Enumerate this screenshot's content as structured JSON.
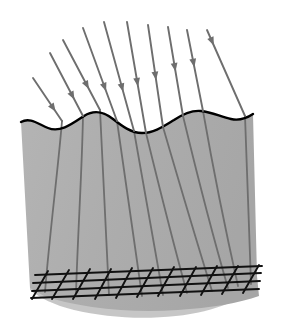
{
  "figure": {
    "title": "",
    "caption": "",
    "background_color": "#ffffff",
    "width": 282,
    "height": 331
  },
  "colors": {
    "medium_fill": "#adadad",
    "medium_fill_light": "#b8b8b8",
    "medium_fill_shadow": "#a3a3a3",
    "surface_stroke": "#000000",
    "ray_stroke": "#6e6e6e",
    "ray_stroke_dark": "#5e5e5e",
    "grid_stroke": "#111111",
    "background": "#ffffff"
  },
  "medium": {
    "label": "refracting medium body",
    "top_surface_label": "wavy interface surface",
    "surface_stroke_width": 2.4,
    "left_edge_top_x": 21,
    "left_edge_bottom_x": 31,
    "right_edge_top_x": 253,
    "right_edge_bottom_x": 259,
    "top_y_left": 123,
    "top_y_right": 114,
    "bottom_y": 300,
    "wave_crest_count": 3,
    "wave_trough_count": 2,
    "surface_path": "M 21 122 C 30 117 38 124 48 128 C 60 133 72 124 84 116 C 95 109 104 112 113 119 C 122 126 131 133 142 133 C 154 133 164 126 174 120 C 183 114 192 110 201 111 C 212 112 221 117 231 119 C 240 121 247 118 253 114",
    "body_path": "M 21 122 C 30 117 38 124 48 128 C 60 133 72 124 84 116 C 95 109 104 112 113 119 C 122 126 131 133 142 133 C 154 133 164 126 174 120 C 183 114 192 110 201 111 C 212 112 221 117 231 119 C 240 121 247 118 253 114 L 257 276 L 259 296 C 240 303 210 308 178 310 C 150 312 120 311 92 307 C 72 304 56 300 44 296 L 30 288 Z"
  },
  "incident_rays": {
    "label": "incident light rays",
    "count": 10,
    "stroke_width": 1.9,
    "arrowhead_style": "solid-triangle-midline",
    "direction_note": "rays travel down and to the right, fanning from steeply-slanted on the left to nearly vertical on the right",
    "rays": [
      {
        "id": "ray-1",
        "x1": 33,
        "y1": 78,
        "x2": 62,
        "y2": 121,
        "head_t": 0.78
      },
      {
        "id": "ray-2",
        "x1": 50,
        "y1": 53,
        "x2": 83,
        "y2": 116,
        "head_t": 0.74
      },
      {
        "id": "ray-3",
        "x1": 63,
        "y1": 40,
        "x2": 100,
        "y2": 110,
        "head_t": 0.7
      },
      {
        "id": "ray-4",
        "x1": 83,
        "y1": 28,
        "x2": 117,
        "y2": 121,
        "head_t": 0.68
      },
      {
        "id": "ray-5",
        "x1": 104,
        "y1": 22,
        "x2": 134,
        "y2": 131,
        "head_t": 0.64
      },
      {
        "id": "ray-6",
        "x1": 127,
        "y1": 22,
        "x2": 146,
        "y2": 133,
        "head_t": 0.58
      },
      {
        "id": "ray-7",
        "x1": 148,
        "y1": 25,
        "x2": 163,
        "y2": 127,
        "head_t": 0.54
      },
      {
        "id": "ray-8",
        "x1": 168,
        "y1": 27,
        "x2": 183,
        "y2": 116,
        "head_t": 0.5
      },
      {
        "id": "ray-9",
        "x1": 187,
        "y1": 30,
        "x2": 203,
        "y2": 111,
        "head_t": 0.46
      },
      {
        "id": "ray-10",
        "x1": 207,
        "y1": 30,
        "x2": 245,
        "y2": 116,
        "head_t": 0.18
      }
    ]
  },
  "refracted_rays": {
    "label": "refracted rays inside the medium",
    "count": 10,
    "stroke_width": 1.8,
    "direction_note": "rays bend at the wavy interface and converge downward toward the bottom-right grid",
    "rays": [
      {
        "id": "refracted-1",
        "path": "M 62 121 C 58 170 50 230 45 292"
      },
      {
        "id": "refracted-2",
        "path": "M 83 116 C 82 170 78 230 76 293"
      },
      {
        "id": "refracted-3",
        "path": "M 100 110 C 103 170 106 230 109 295"
      },
      {
        "id": "refracted-4",
        "path": "M 117 121 C 124 172 133 232 142 296"
      },
      {
        "id": "refracted-5",
        "path": "M 134 131 C 142 176 152 234 163 295"
      },
      {
        "id": "refracted-6",
        "path": "M 146 133 C 157 178 171 235 187 293"
      },
      {
        "id": "refracted-7",
        "path": "M 163 127 C 177 175 194 233 212 291"
      },
      {
        "id": "refracted-8",
        "path": "M 183 116 C 196 170 211 230 228 288"
      },
      {
        "id": "refracted-9",
        "path": "M 203 111 C 213 168 225 228 238 286"
      },
      {
        "id": "refracted-10",
        "path": "M 245 116 C 247 168 249 228 251 284"
      }
    ]
  },
  "bottom_grid": {
    "label": "mesh grid at base of medium",
    "stroke_width": 1.9,
    "horizontal_line_count": 4,
    "diagonal_line_count": 11,
    "horizontals": [
      {
        "id": "grid-h-1",
        "x1": 35,
        "y1": 275,
        "x2": 262,
        "y2": 266
      },
      {
        "id": "grid-h-2",
        "x1": 33,
        "y1": 283,
        "x2": 261,
        "y2": 273
      },
      {
        "id": "grid-h-3",
        "x1": 32,
        "y1": 291,
        "x2": 260,
        "y2": 281
      },
      {
        "id": "grid-h-4",
        "x1": 31,
        "y1": 298,
        "x2": 259,
        "y2": 289
      }
    ],
    "diagonals": [
      {
        "id": "grid-d-1",
        "x1": 48,
        "y1": 271,
        "x2": 32,
        "y2": 299
      },
      {
        "id": "grid-d-2",
        "x1": 69,
        "y1": 270,
        "x2": 52,
        "y2": 299
      },
      {
        "id": "grid-d-3",
        "x1": 90,
        "y1": 269,
        "x2": 73,
        "y2": 299
      },
      {
        "id": "grid-d-4",
        "x1": 111,
        "y1": 269,
        "x2": 95,
        "y2": 299
      },
      {
        "id": "grid-d-5",
        "x1": 132,
        "y1": 268,
        "x2": 116,
        "y2": 298
      },
      {
        "id": "grid-d-6",
        "x1": 153,
        "y1": 268,
        "x2": 137,
        "y2": 297
      },
      {
        "id": "grid-d-7",
        "x1": 174,
        "y1": 267,
        "x2": 158,
        "y2": 296
      },
      {
        "id": "grid-d-8",
        "x1": 196,
        "y1": 267,
        "x2": 180,
        "y2": 296
      },
      {
        "id": "grid-d-9",
        "x1": 217,
        "y1": 266,
        "x2": 201,
        "y2": 295
      },
      {
        "id": "grid-d-10",
        "x1": 238,
        "y1": 266,
        "x2": 222,
        "y2": 294
      },
      {
        "id": "grid-d-11",
        "x1": 259,
        "y1": 265,
        "x2": 243,
        "y2": 293
      }
    ]
  }
}
